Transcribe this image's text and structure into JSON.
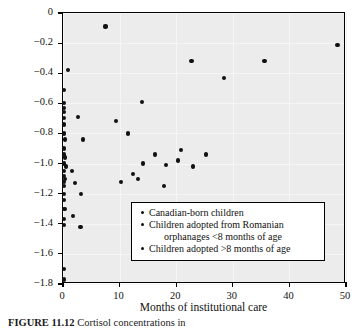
{
  "figure": {
    "caption_label": "FIGURE 11.12",
    "caption_body": "Cortisol concentrations in"
  },
  "chart_data": {
    "type": "scatter",
    "title": "",
    "xlabel": "Months of institutional care",
    "ylabel": "Evening cortisol (log 10)",
    "xlim": [
      0,
      50
    ],
    "ylim": [
      -1.8,
      0
    ],
    "xticks": [
      0,
      10,
      20,
      30,
      40,
      50
    ],
    "yticks": [
      0,
      -0.2,
      -0.4,
      -0.6,
      -0.8,
      -1.0,
      -1.2,
      -1.4,
      -1.6,
      -1.8
    ],
    "xticklabels": [
      "0",
      "10",
      "20",
      "30",
      "40",
      "50"
    ],
    "yticklabels": [
      "0",
      "−0.2",
      "−0.4",
      "−0.6",
      "−0.8",
      "−1.0",
      "−1.2",
      "−1.4",
      "−1.6",
      "−1.8"
    ],
    "grid": true,
    "legend_position": "lower right",
    "marker": "filled-circle",
    "marker_color": "#111111",
    "plot_background": "#ececec",
    "series": [
      {
        "name": "Canadian-born children",
        "points": [
          [
            0.2,
            -0.51
          ],
          [
            0.2,
            -0.6
          ],
          [
            0.2,
            -0.63
          ],
          [
            0.2,
            -0.66
          ],
          [
            0.2,
            -0.7
          ],
          [
            0.2,
            -0.74
          ],
          [
            0.2,
            -0.8
          ],
          [
            0.3,
            -0.84
          ],
          [
            0.2,
            -0.9
          ],
          [
            0.2,
            -0.94
          ],
          [
            0.4,
            -0.96
          ],
          [
            0.2,
            -1.0
          ],
          [
            0.5,
            -1.02
          ],
          [
            0.2,
            -1.05
          ],
          [
            0.2,
            -1.08
          ],
          [
            0.4,
            -1.1
          ],
          [
            0.2,
            -1.12
          ],
          [
            0.2,
            -1.15
          ],
          [
            0.2,
            -1.2
          ],
          [
            0.2,
            -1.24
          ],
          [
            0.2,
            -1.3
          ],
          [
            0.3,
            -1.3
          ],
          [
            0.2,
            -1.37
          ],
          [
            0.2,
            -1.41
          ],
          [
            0.2,
            -1.7
          ],
          [
            0.2,
            -1.77
          ]
        ]
      },
      {
        "name": "Children adopted from Romanian orphanages <8 months of age",
        "points": [
          [
            0.9,
            -0.38
          ],
          [
            2.6,
            -0.69
          ],
          [
            3.6,
            -0.84
          ],
          [
            1.6,
            -1.05
          ],
          [
            2.1,
            -1.13
          ],
          [
            3.2,
            -1.2
          ],
          [
            1.8,
            -1.35
          ],
          [
            3.1,
            -1.42
          ]
        ]
      },
      {
        "name": "Children adopted >8 months of age",
        "points": [
          [
            7.5,
            -0.09
          ],
          [
            48.5,
            -0.21
          ],
          [
            22.7,
            -0.32
          ],
          [
            35.6,
            -0.32
          ],
          [
            28.5,
            -0.43
          ],
          [
            13.9,
            -0.59
          ],
          [
            9.4,
            -0.72
          ],
          [
            11.5,
            -0.8
          ],
          [
            20.8,
            -0.91
          ],
          [
            16.3,
            -0.94
          ],
          [
            25.2,
            -0.94
          ],
          [
            20.3,
            -0.98
          ],
          [
            14.2,
            -1.0
          ],
          [
            18.2,
            -1.01
          ],
          [
            22.9,
            -1.02
          ],
          [
            12.3,
            -1.07
          ],
          [
            13.2,
            -1.1
          ],
          [
            10.3,
            -1.12
          ],
          [
            17.8,
            -1.15
          ]
        ]
      }
    ]
  },
  "legend": {
    "items": [
      {
        "line1": "Canadian-born children",
        "line2": ""
      },
      {
        "line1": "Children adopted from Romanian",
        "line2": "orphanages <8 months of age"
      },
      {
        "line1": "Children adopted >8 months of age",
        "line2": ""
      }
    ]
  }
}
